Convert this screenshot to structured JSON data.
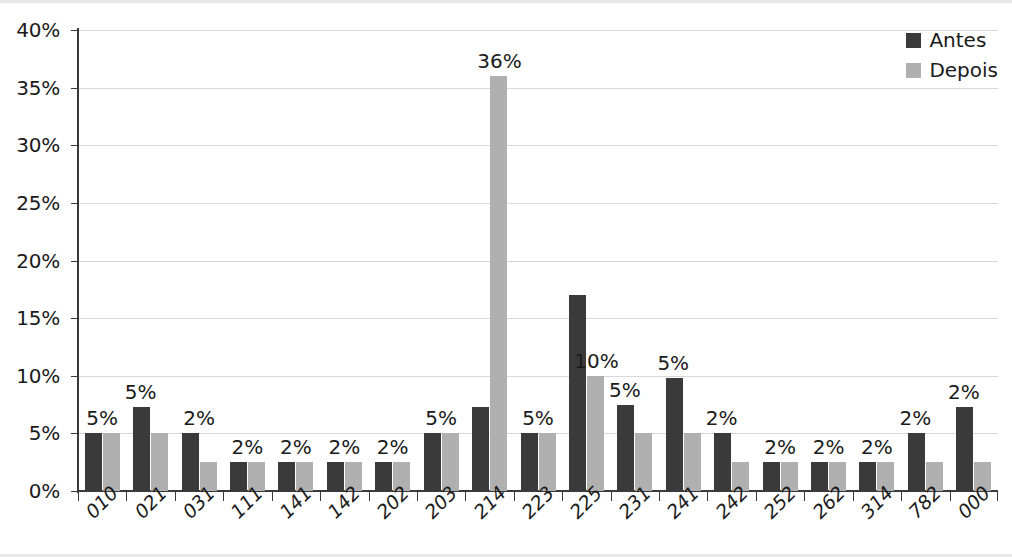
{
  "chart_data": {
    "type": "bar",
    "title": "",
    "xlabel": "",
    "ylabel": "",
    "ylim": [
      0,
      40
    ],
    "ytick_step": 5,
    "grid": true,
    "legend_position": "top-right",
    "categories": [
      "010",
      "021",
      "031",
      "111",
      "141",
      "142",
      "202",
      "203",
      "214",
      "223",
      "225",
      "231",
      "241",
      "242",
      "252",
      "262",
      "314",
      "782",
      "000"
    ],
    "ytick_labels": [
      "40%",
      "35%",
      "30%",
      "25%",
      "20%",
      "15%",
      "10%",
      "5%",
      "0%"
    ],
    "ytick_values": [
      40,
      35,
      30,
      25,
      20,
      15,
      10,
      5,
      0
    ],
    "series": [
      {
        "name": "Antes",
        "color": "#3a3a3a",
        "values": [
          5,
          7.3,
          5,
          2.5,
          2.5,
          2.5,
          2.5,
          5,
          7.3,
          5,
          17,
          7.5,
          9.8,
          5,
          2.5,
          2.5,
          2.5,
          5,
          7.3
        ]
      },
      {
        "name": "Depois",
        "color": "#b0b0b0",
        "values": [
          5,
          5,
          2.5,
          2.5,
          2.5,
          2.5,
          2.5,
          5,
          36,
          5,
          10,
          5,
          5,
          2.5,
          2.5,
          2.5,
          2.5,
          2.5,
          2.5
        ]
      }
    ],
    "point_labels": [
      "5%",
      "5%",
      "2%",
      "2%",
      "2%",
      "2%",
      "2%",
      "5%",
      "36%",
      "5%",
      "10%",
      "5%",
      "5%",
      "2%",
      "2%",
      "2%",
      "2%",
      "2%",
      "2%"
    ],
    "point_label_anchor": [
      "group",
      "antes",
      "group",
      "group",
      "group",
      "group",
      "group",
      "group",
      "depois",
      "group",
      "depois",
      "antes",
      "antes",
      "antes",
      "group",
      "group",
      "group",
      "antes",
      "antes"
    ]
  },
  "legend": {
    "items": [
      {
        "label": "Antes",
        "color": "#3a3a3a"
      },
      {
        "label": "Depois",
        "color": "#b0b0b0"
      }
    ]
  }
}
